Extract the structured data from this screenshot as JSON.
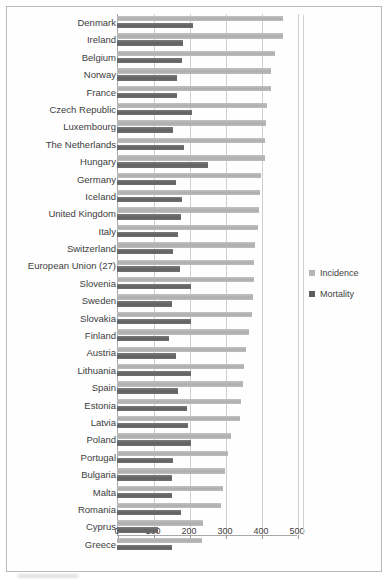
{
  "chart_data": {
    "type": "bar",
    "orientation": "horizontal",
    "title": "",
    "subtitle": "",
    "xlabel": "",
    "ylabel": "",
    "xlim": [
      0,
      500
    ],
    "xticks": [
      0,
      100,
      200,
      300,
      400,
      500
    ],
    "xtick_labels": [
      "0",
      "100",
      "200",
      "300",
      "400",
      "500"
    ],
    "grid": true,
    "legend_position": "right",
    "colors": {
      "incidence": "#b6b6b6",
      "mortality": "#6d6d6d",
      "gridline": "#cfcfcf",
      "axis": "#a8a8a8",
      "text": "#3d3d3d"
    },
    "categories": [
      "Denmark",
      "Ireland",
      "Belgium",
      "Norway",
      "France",
      "Czech Republic",
      "Luxembourg",
      "The Netherlands",
      "Hungary",
      "Germany",
      "Iceland",
      "United Kingdom",
      "Italy",
      "Switzerland",
      "European Union (27)",
      "Slovenia",
      "Sweden",
      "Slovakia",
      "Finland",
      "Austria",
      "Lithuania",
      "Spain",
      "Estonia",
      "Latvia",
      "Poland",
      "Portugal",
      "Bulgaria",
      "Malta",
      "Romania",
      "Cyprus",
      "Greece"
    ],
    "series": [
      {
        "name": "Incidence",
        "color": "#b6b6b6",
        "values": [
          461,
          460,
          440,
          428,
          427,
          418,
          414,
          412,
          411,
          400,
          397,
          394,
          391,
          384,
          381,
          380,
          377,
          375,
          366,
          359,
          354,
          350,
          345,
          342,
          318,
          307,
          300,
          295,
          288,
          238,
          235
        ]
      },
      {
        "name": "Mortality",
        "color": "#6d6d6d",
        "values": [
          211,
          184,
          180,
          168,
          166,
          209,
          156,
          187,
          253,
          165,
          180,
          178,
          169,
          155,
          175,
          206,
          154,
          206,
          144,
          165,
          206,
          169,
          195,
          196,
          205,
          155,
          154,
          152,
          178,
          113,
          152
        ]
      }
    ]
  },
  "legend": {
    "items": [
      {
        "label": "Incidence",
        "swatch_class": "sw-incidence",
        "icon": "square-swatch-icon"
      },
      {
        "label": "Mortality",
        "swatch_class": "sw-mortality",
        "icon": "square-swatch-icon"
      }
    ]
  }
}
